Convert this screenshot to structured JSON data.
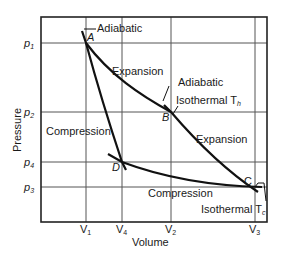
{
  "diagram": {
    "axes": {
      "xlabel": "Volume",
      "ylabel": "Pressure",
      "x_ticks": [
        {
          "label": "V",
          "sub": "1"
        },
        {
          "label": "V",
          "sub": "4"
        },
        {
          "label": "V",
          "sub": "2"
        },
        {
          "label": "V",
          "sub": "3"
        }
      ],
      "y_ticks": [
        {
          "label": "p",
          "sub": "1"
        },
        {
          "label": "p",
          "sub": "2"
        },
        {
          "label": "p",
          "sub": "4"
        },
        {
          "label": "p",
          "sub": "3"
        }
      ]
    },
    "points": {
      "A": "A",
      "B": "B",
      "C": "C",
      "D": "D"
    },
    "annotations": {
      "adiabatic_top": "Adiabatic",
      "expansion_top": "Expansion",
      "adiabatic_mid": "Adiabatic",
      "isothermal_hot": "Isothermal T",
      "isothermal_hot_sub": "h",
      "compression_left": "Compression",
      "expansion_right": "Expansion",
      "compression_bottom": "Compression",
      "isothermal_cold": "Isothermal T",
      "isothermal_cold_sub": "c"
    }
  }
}
